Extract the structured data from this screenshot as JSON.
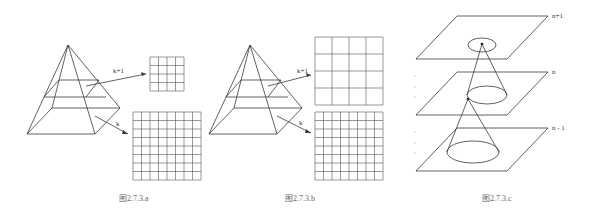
{
  "figures": [
    {
      "id": "a",
      "caption": "图2.7.3.a",
      "labels": {
        "upper": "k+1",
        "lower": "k"
      },
      "grids": {
        "upper": {
          "rows": 4,
          "cols": 4
        },
        "lower": {
          "rows": 8,
          "cols": 8
        }
      }
    },
    {
      "id": "b",
      "caption": "图2.7.3.b",
      "labels": {
        "upper": "k+1",
        "lower": "k"
      },
      "grids": {
        "upper": {
          "rows": 4,
          "cols": 4
        },
        "lower": {
          "rows": 8,
          "cols": 8
        }
      }
    },
    {
      "id": "c",
      "caption": "图2.7.3.c",
      "labels": {
        "top": "n+1",
        "middle": "n",
        "bottom": "n - 1"
      }
    }
  ]
}
